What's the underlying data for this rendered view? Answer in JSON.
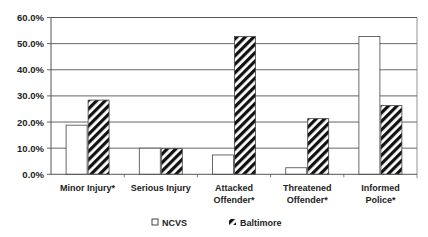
{
  "chart_data": {
    "type": "bar",
    "title": "",
    "xlabel": "",
    "ylabel": "",
    "ylim": [
      0,
      60
    ],
    "yticks": [
      "0.0%",
      "10.0%",
      "20.0%",
      "30.0%",
      "40.0%",
      "50.0%",
      "60.0%"
    ],
    "grid": true,
    "legend_position": "bottom",
    "categories": [
      "Minor Injury*",
      "Serious Injury",
      "Attacked Offender*",
      "Threatened Offender*",
      "Informed Police*"
    ],
    "category_lines": [
      [
        "Minor Injury*"
      ],
      [
        "Serious Injury"
      ],
      [
        "Attacked",
        "Offender*"
      ],
      [
        "Threatened",
        "Offender*"
      ],
      [
        "Informed",
        "Police*"
      ]
    ],
    "series": [
      {
        "name": "NCVS",
        "pattern": "solid-white",
        "values": [
          18.8,
          10.0,
          7.4,
          2.5,
          52.7
        ]
      },
      {
        "name": "Baltimore",
        "pattern": "diagonal-hatch",
        "values": [
          28.4,
          9.8,
          52.7,
          21.3,
          26.3
        ]
      }
    ]
  },
  "legend": {
    "ncvs_label": "NCVS",
    "baltimore_label": "Baltimore"
  }
}
